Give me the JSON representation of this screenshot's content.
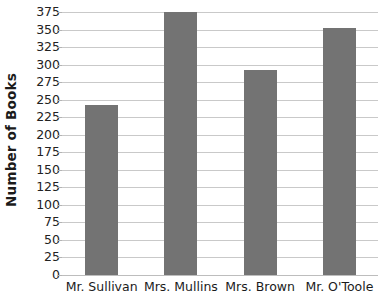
{
  "chart_data": {
    "type": "bar",
    "title": "",
    "xlabel": "",
    "ylabel": "Number of Books",
    "categories": [
      "Mr. Sullivan",
      "Mrs. Mullins",
      "Mrs. Brown",
      "Mr. O'Toole"
    ],
    "values": [
      242,
      375,
      292,
      352
    ],
    "ylim": [
      0,
      375
    ],
    "ytick_step": 25,
    "yticks": [
      0,
      25,
      50,
      75,
      100,
      125,
      150,
      175,
      200,
      225,
      250,
      275,
      300,
      325,
      350,
      375
    ],
    "ytick_labels": [
      "0",
      "25",
      "50",
      "75",
      "100",
      "125",
      "150",
      "175",
      "200",
      "225",
      "250",
      "275",
      "300",
      "325",
      "350",
      "375"
    ],
    "grid": true,
    "grid_axis": "y",
    "legend": false,
    "legend_position": "none",
    "bar_color": "#737373",
    "grid_color": "#c9c9c9",
    "axis_color": "#bdbdbd",
    "text_color": "#1b1b1b",
    "background": "#ffffff"
  }
}
